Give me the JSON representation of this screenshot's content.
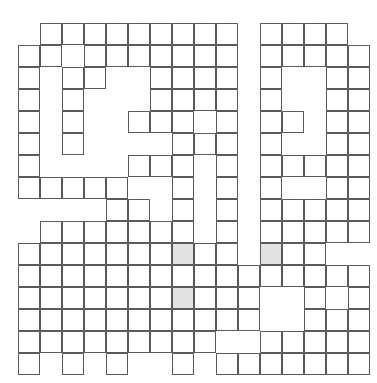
{
  "puzzle": {
    "title": "Crossword Grid",
    "type": "blank-crossword-grid",
    "grid": {
      "columns": 16,
      "rows": 16,
      "cell_size_px": 22,
      "origin_x_px": 18,
      "origin_y_px": 23,
      "line_color": "#595959",
      "cell_fill_color": "#ffffff",
      "shaded_fill_color": "#e2e2e2",
      "background_color": "#ffffff",
      "total_cells": 198,
      "shaded_cell_count": 3
    },
    "legend": {
      "open_cell": "empty writable square",
      "shaded_cell": "highlighted square"
    },
    "rows": [
      {
        "index": 0,
        "cells": [
          1,
          2,
          3,
          4,
          5,
          6,
          7,
          8,
          9,
          11,
          12,
          13,
          14
        ]
      },
      {
        "index": 1,
        "cells": [
          0,
          1,
          2,
          3,
          4,
          5,
          6,
          7,
          8,
          9,
          11,
          12,
          13,
          14,
          15
        ]
      },
      {
        "index": 2,
        "cells": [
          0,
          1,
          2,
          3,
          4,
          5,
          6,
          7,
          8,
          9,
          11,
          12,
          13,
          14,
          15
        ]
      },
      {
        "index": 3,
        "cells": [
          0,
          1,
          2,
          3,
          4,
          5,
          6,
          7,
          8,
          9,
          11,
          12,
          13,
          14,
          15
        ]
      },
      {
        "index": 4,
        "cells": [
          0,
          1,
          2,
          3,
          4,
          5,
          6,
          7,
          8,
          9,
          11,
          12,
          13,
          14,
          15
        ]
      },
      {
        "index": 5,
        "cells": [
          0,
          1,
          2,
          3,
          4,
          5,
          6,
          7,
          8,
          9,
          11,
          12,
          13,
          14,
          15
        ]
      },
      {
        "index": 6,
        "cells": [
          0,
          1,
          2,
          3,
          4,
          5,
          6,
          7,
          8,
          9,
          11,
          12,
          13,
          14,
          15
        ]
      },
      {
        "index": 7,
        "cells": [
          0,
          1,
          2,
          3,
          4,
          5,
          6,
          7,
          8,
          9,
          11,
          12,
          13,
          14,
          15
        ]
      },
      {
        "index": 8,
        "cells": [
          0,
          1,
          2,
          3,
          4,
          5,
          6,
          7,
          8,
          9,
          11,
          12,
          13,
          14,
          15
        ]
      },
      {
        "index": 9,
        "cells": [
          1,
          2,
          3,
          4,
          5,
          6,
          7,
          8,
          9,
          11,
          12,
          13,
          14,
          15
        ]
      },
      {
        "index": 10,
        "cells": [
          0,
          1,
          2,
          3,
          4,
          5,
          6,
          7,
          8,
          9,
          10,
          11,
          12,
          13,
          14,
          15
        ]
      },
      {
        "index": 11,
        "cells": [
          0,
          1,
          2,
          3,
          4,
          5,
          6,
          7,
          8,
          9,
          10,
          11,
          12,
          13,
          14,
          15
        ]
      },
      {
        "index": 12,
        "cells": [
          0,
          1,
          2,
          3,
          4,
          5,
          6,
          7,
          8,
          9,
          10,
          11,
          12,
          13,
          14,
          15
        ]
      },
      {
        "index": 13,
        "cells": [
          0,
          1,
          2,
          3,
          4,
          5,
          6,
          7,
          8,
          9,
          10,
          11,
          12,
          13,
          14,
          15
        ]
      },
      {
        "index": 14,
        "cells": [
          0,
          1,
          2,
          3,
          4,
          5,
          6,
          7,
          8,
          9,
          10,
          11,
          12,
          13,
          14,
          15
        ]
      },
      {
        "index": 15,
        "cells": [
          0,
          2,
          4,
          7,
          9,
          10,
          11,
          12,
          13,
          14,
          15
        ]
      }
    ],
    "open_cells": [
      [
        0,
        1
      ],
      [
        0,
        2
      ],
      [
        0,
        3
      ],
      [
        0,
        4
      ],
      [
        0,
        5
      ],
      [
        0,
        6
      ],
      [
        0,
        7
      ],
      [
        0,
        8
      ],
      [
        0,
        9
      ],
      [
        0,
        11
      ],
      [
        0,
        12
      ],
      [
        0,
        13
      ],
      [
        0,
        14
      ],
      [
        1,
        0
      ],
      [
        1,
        1
      ],
      [
        1,
        3
      ],
      [
        1,
        4
      ],
      [
        1,
        5
      ],
      [
        1,
        6
      ],
      [
        1,
        7
      ],
      [
        1,
        8
      ],
      [
        1,
        9
      ],
      [
        1,
        11
      ],
      [
        1,
        12
      ],
      [
        1,
        13
      ],
      [
        1,
        14
      ],
      [
        1,
        15
      ],
      [
        2,
        0
      ],
      [
        2,
        2
      ],
      [
        2,
        3
      ],
      [
        2,
        6
      ],
      [
        2,
        7
      ],
      [
        2,
        8
      ],
      [
        2,
        9
      ],
      [
        2,
        11
      ],
      [
        2,
        14
      ],
      [
        2,
        15
      ],
      [
        3,
        0
      ],
      [
        3,
        2
      ],
      [
        3,
        6
      ],
      [
        3,
        7
      ],
      [
        3,
        8
      ],
      [
        3,
        9
      ],
      [
        3,
        11
      ],
      [
        3,
        14
      ],
      [
        3,
        15
      ],
      [
        4,
        0
      ],
      [
        4,
        2
      ],
      [
        4,
        5
      ],
      [
        4,
        6
      ],
      [
        4,
        7
      ],
      [
        4,
        9
      ],
      [
        4,
        11
      ],
      [
        4,
        12
      ],
      [
        4,
        14
      ],
      [
        4,
        15
      ],
      [
        5,
        0
      ],
      [
        5,
        2
      ],
      [
        5,
        7
      ],
      [
        5,
        8
      ],
      [
        5,
        9
      ],
      [
        5,
        11
      ],
      [
        5,
        14
      ],
      [
        5,
        15
      ],
      [
        6,
        0
      ],
      [
        6,
        5
      ],
      [
        6,
        6
      ],
      [
        6,
        7
      ],
      [
        6,
        9
      ],
      [
        6,
        11
      ],
      [
        6,
        12
      ],
      [
        6,
        13
      ],
      [
        6,
        14
      ],
      [
        6,
        15
      ],
      [
        7,
        0
      ],
      [
        7,
        1
      ],
      [
        7,
        2
      ],
      [
        7,
        3
      ],
      [
        7,
        4
      ],
      [
        7,
        7
      ],
      [
        7,
        9
      ],
      [
        7,
        11
      ],
      [
        7,
        14
      ],
      [
        7,
        15
      ],
      [
        8,
        4
      ],
      [
        8,
        5
      ],
      [
        8,
        7
      ],
      [
        8,
        9
      ],
      [
        8,
        11
      ],
      [
        8,
        12
      ],
      [
        8,
        13
      ],
      [
        8,
        14
      ],
      [
        8,
        15
      ],
      [
        9,
        1
      ],
      [
        9,
        2
      ],
      [
        9,
        3
      ],
      [
        9,
        4
      ],
      [
        9,
        5
      ],
      [
        9,
        6
      ],
      [
        9,
        7
      ],
      [
        9,
        9
      ],
      [
        9,
        11
      ],
      [
        9,
        12
      ],
      [
        9,
        13
      ],
      [
        9,
        14
      ],
      [
        9,
        15
      ],
      [
        10,
        0
      ],
      [
        10,
        1
      ],
      [
        10,
        2
      ],
      [
        10,
        3
      ],
      [
        10,
        4
      ],
      [
        10,
        5
      ],
      [
        10,
        6
      ],
      [
        10,
        7
      ],
      [
        10,
        8
      ],
      [
        10,
        9
      ],
      [
        10,
        11
      ],
      [
        10,
        12
      ],
      [
        10,
        13
      ],
      [
        11,
        0
      ],
      [
        11,
        1
      ],
      [
        11,
        2
      ],
      [
        11,
        3
      ],
      [
        11,
        4
      ],
      [
        11,
        5
      ],
      [
        11,
        6
      ],
      [
        11,
        7
      ],
      [
        11,
        8
      ],
      [
        11,
        9
      ],
      [
        11,
        10
      ],
      [
        11,
        11
      ],
      [
        11,
        12
      ],
      [
        11,
        13
      ],
      [
        11,
        14
      ],
      [
        11,
        15
      ],
      [
        12,
        0
      ],
      [
        12,
        1
      ],
      [
        12,
        2
      ],
      [
        12,
        3
      ],
      [
        12,
        4
      ],
      [
        12,
        5
      ],
      [
        12,
        6
      ],
      [
        12,
        7
      ],
      [
        12,
        8
      ],
      [
        12,
        9
      ],
      [
        12,
        10
      ],
      [
        12,
        13
      ],
      [
        12,
        15
      ],
      [
        13,
        0
      ],
      [
        13,
        1
      ],
      [
        13,
        2
      ],
      [
        13,
        3
      ],
      [
        13,
        4
      ],
      [
        13,
        5
      ],
      [
        13,
        6
      ],
      [
        13,
        7
      ],
      [
        13,
        8
      ],
      [
        13,
        9
      ],
      [
        13,
        10
      ],
      [
        13,
        13
      ],
      [
        13,
        14
      ],
      [
        13,
        15
      ],
      [
        14,
        0
      ],
      [
        14,
        1
      ],
      [
        14,
        2
      ],
      [
        14,
        3
      ],
      [
        14,
        4
      ],
      [
        14,
        5
      ],
      [
        14,
        6
      ],
      [
        14,
        7
      ],
      [
        14,
        8
      ],
      [
        14,
        11
      ],
      [
        14,
        12
      ],
      [
        14,
        13
      ],
      [
        14,
        14
      ],
      [
        14,
        15
      ],
      [
        15,
        0
      ],
      [
        15,
        2
      ],
      [
        15,
        4
      ],
      [
        15,
        7
      ],
      [
        15,
        9
      ],
      [
        15,
        10
      ],
      [
        15,
        11
      ],
      [
        15,
        12
      ],
      [
        15,
        13
      ],
      [
        15,
        14
      ],
      [
        15,
        15
      ]
    ],
    "shaded_cells": [
      [
        10,
        7
      ],
      [
        10,
        11
      ],
      [
        12,
        7
      ]
    ]
  }
}
